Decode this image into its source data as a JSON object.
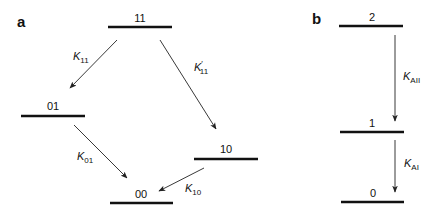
{
  "panels": {
    "a": {
      "label": "a",
      "levels": {
        "l11": {
          "label": "11"
        },
        "l01": {
          "label": "01"
        },
        "l10": {
          "label": "10"
        },
        "l00": {
          "label": "00"
        }
      },
      "transitions": {
        "t11_01": {
          "symbol": "K",
          "subscript": "11",
          "prime": "",
          "from": "11",
          "to": "01"
        },
        "t11_10": {
          "symbol": "K",
          "subscript": "11",
          "prime": "′",
          "from": "11",
          "to": "10"
        },
        "t01_00": {
          "symbol": "K",
          "subscript": "01",
          "prime": "",
          "from": "01",
          "to": "00"
        },
        "t10_00": {
          "symbol": "K",
          "subscript": "10",
          "prime": "",
          "from": "10",
          "to": "00"
        }
      }
    },
    "b": {
      "label": "b",
      "levels": {
        "l2": {
          "label": "2"
        },
        "l1": {
          "label": "1"
        },
        "l0": {
          "label": "0"
        }
      },
      "transitions": {
        "t2_1": {
          "symbol": "K",
          "subscript": "AII",
          "from": "2",
          "to": "1"
        },
        "t1_0": {
          "symbol": "K",
          "subscript": "AI",
          "from": "1",
          "to": "0"
        }
      }
    }
  },
  "colors": {
    "ink": "#111111",
    "arrow": "#222222",
    "background": "#ffffff"
  }
}
